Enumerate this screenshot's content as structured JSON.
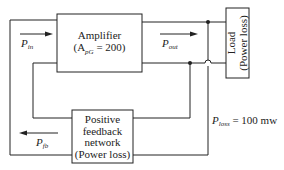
{
  "diagram": {
    "title": "",
    "blocks": {
      "amplifier": {
        "line1": "Amplifier",
        "line2_prefix": "(A",
        "line2_sub": "pG",
        "line2_suffix": " = 200)"
      },
      "load": {
        "line1": "Load",
        "line2": "(Power loss)"
      },
      "feedback": {
        "line1": "Positive",
        "line2": "feedback",
        "line3": "network",
        "line4": "(Power loss)"
      }
    },
    "signals": {
      "p_in": {
        "symbol": "P",
        "sub": "in",
        "direction": "right"
      },
      "p_out": {
        "symbol": "P",
        "sub": "out",
        "direction": "right"
      },
      "p_fb": {
        "symbol": "P",
        "sub": "fb",
        "direction": "left"
      }
    },
    "annotations": {
      "p_loss": {
        "symbol": "P",
        "sub": "loss",
        "value": " = 100 mw"
      }
    },
    "colors": {
      "line": "#222222",
      "background": "#ffffff"
    }
  }
}
